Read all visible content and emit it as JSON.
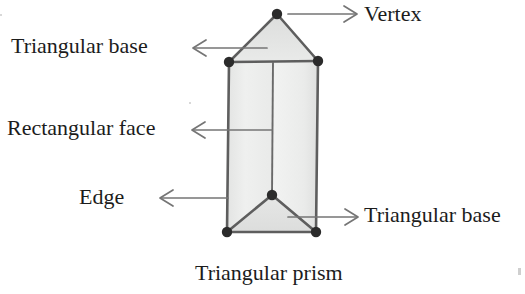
{
  "figure": {
    "title": "Triangular prism",
    "shape_name": "triangular-prism",
    "fill_color": "#ececec",
    "face_fill_left": "#eeefee",
    "face_fill_right": "#f2f3f2",
    "top_triangle_fill": "#e4e5e4",
    "bottom_triangle_fill": "#e8e9e8",
    "outline_color": "#5a5a5a",
    "vertex_color": "#2b2b2b",
    "arrow_color": "#6e6e6e",
    "background_color": "#ffffff",
    "text_color": "#1c1c1c"
  },
  "labels": {
    "vertex": "Vertex",
    "triangular_base_top": "Triangular base",
    "rectangular_face": "Rectangular face",
    "edge": "Edge",
    "triangular_base_bottom": "Triangular base"
  },
  "caption": "Triangular prism",
  "annotations": [
    {
      "name": "vertex",
      "text": "Vertex",
      "arrow_direction": "right",
      "points_to": "apex-vertex"
    },
    {
      "name": "triangular-base-top",
      "text": "Triangular base",
      "arrow_direction": "left",
      "points_to": "top-triangular-face"
    },
    {
      "name": "rectangular-face",
      "text": "Rectangular face",
      "arrow_direction": "left",
      "points_to": "front-rectangular-face"
    },
    {
      "name": "edge",
      "text": "Edge",
      "arrow_direction": "left",
      "points_to": "left-vertical-edge"
    },
    {
      "name": "triangular-base-bottom",
      "text": "Triangular base",
      "arrow_direction": "right",
      "points_to": "bottom-triangular-face"
    }
  ],
  "geometry": {
    "apex": [
      277,
      14
    ],
    "top_left": [
      229,
      62
    ],
    "top_right": [
      318,
      61
    ],
    "bottom_mid": [
      272,
      195
    ],
    "bottom_left": [
      227,
      232
    ],
    "bottom_right": [
      316,
      232
    ],
    "vertex_count_visible": 6
  }
}
